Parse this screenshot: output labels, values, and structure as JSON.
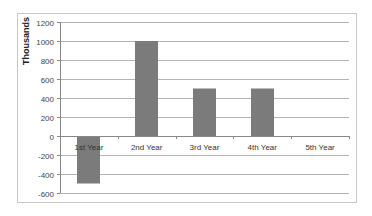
{
  "chart_data": {
    "type": "bar",
    "title": "",
    "xlabel": "",
    "ylabel": "Thousands",
    "categories": [
      "1st Year",
      "2nd Year",
      "3rd Year",
      "4th Year",
      "5th Year"
    ],
    "values": [
      -500,
      1000,
      500,
      500,
      0
    ],
    "ylim": [
      -600,
      1200
    ],
    "yticks": [
      1200,
      1000,
      800,
      600,
      400,
      200,
      0,
      -200,
      -400,
      -600
    ],
    "grid": true,
    "legend": "none",
    "bar_color": "#7b7b7b"
  }
}
